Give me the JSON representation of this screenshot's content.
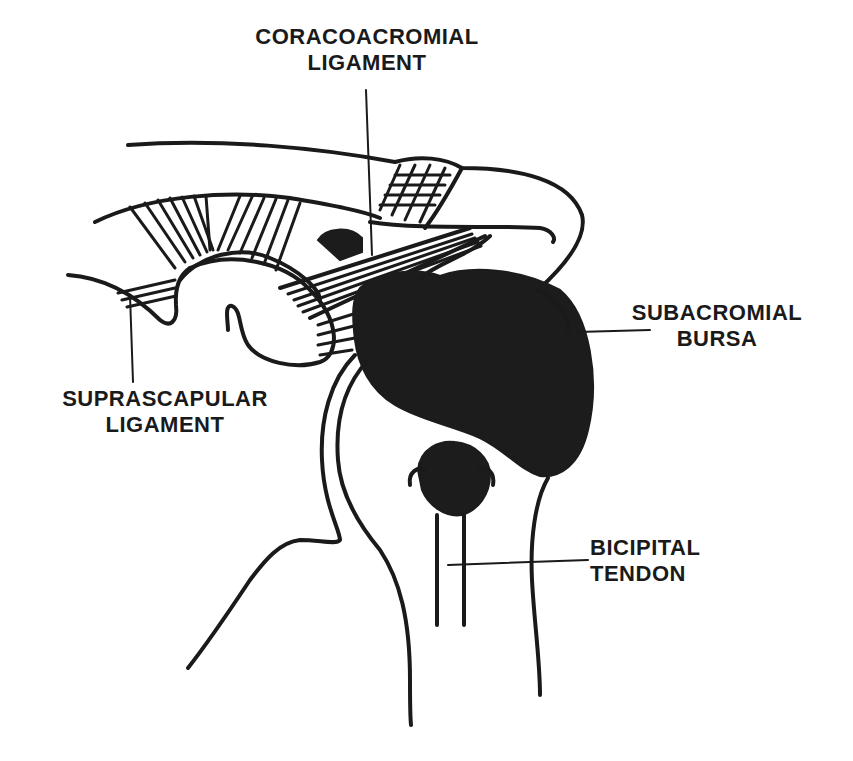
{
  "figure": {
    "ink_color": "#1a1a1a",
    "background": "#ffffff"
  },
  "labels": {
    "coracoacromial": {
      "line1": "CORACOACROMIAL",
      "line2": "LIGAMENT"
    },
    "subacromial": {
      "line1": "SUBACROMIAL",
      "line2": "BURSA"
    },
    "suprascapular": {
      "line1": "SUPRASCAPULAR",
      "line2": "LIGAMENT"
    },
    "bicipital": {
      "line1": "BICIPITAL",
      "line2": "TENDON"
    }
  }
}
